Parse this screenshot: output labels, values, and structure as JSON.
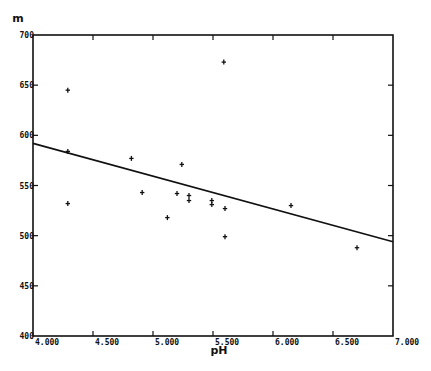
{
  "chart_data": {
    "type": "scatter",
    "title": "",
    "xlabel": "pH",
    "ylabel": "m",
    "xlim": [
      4.0,
      7.0
    ],
    "ylim": [
      400,
      700
    ],
    "grid": false,
    "legend": null,
    "x_ticks": [
      4.0,
      4.5,
      5.0,
      5.5,
      6.0,
      6.5,
      7.0
    ],
    "x_tick_labels": [
      "4.000",
      "4.500",
      "5.000",
      "5.500",
      "6.000",
      "6.500",
      "7.000"
    ],
    "y_ticks": [
      400,
      450,
      500,
      550,
      600,
      650,
      700
    ],
    "y_tick_labels": [
      "400",
      "450",
      "500",
      "550",
      "600",
      "650",
      "700"
    ],
    "series": [
      {
        "name": "observations",
        "marker": "+",
        "points": [
          {
            "x": 4.29,
            "y": 645
          },
          {
            "x": 4.29,
            "y": 584
          },
          {
            "x": 4.29,
            "y": 532
          },
          {
            "x": 4.82,
            "y": 577
          },
          {
            "x": 4.91,
            "y": 543
          },
          {
            "x": 5.12,
            "y": 518
          },
          {
            "x": 5.2,
            "y": 542
          },
          {
            "x": 5.24,
            "y": 571
          },
          {
            "x": 5.3,
            "y": 540
          },
          {
            "x": 5.3,
            "y": 535
          },
          {
            "x": 5.49,
            "y": 535
          },
          {
            "x": 5.49,
            "y": 531
          },
          {
            "x": 5.59,
            "y": 673
          },
          {
            "x": 5.6,
            "y": 527
          },
          {
            "x": 5.6,
            "y": 499
          },
          {
            "x": 6.15,
            "y": 530
          },
          {
            "x": 6.7,
            "y": 488
          }
        ]
      },
      {
        "name": "regression line",
        "type": "line",
        "points": [
          {
            "x": 4.0,
            "y": 592
          },
          {
            "x": 7.0,
            "y": 494
          }
        ]
      }
    ]
  }
}
